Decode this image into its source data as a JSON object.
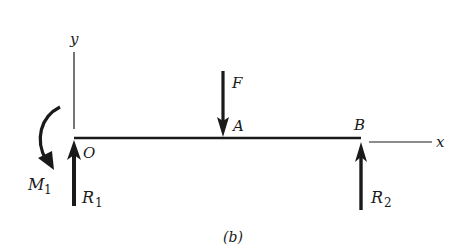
{
  "figure": {
    "caption": "(b)",
    "colors": {
      "ink": "#1a1a1a",
      "background": "#ffffff"
    }
  },
  "axes": {
    "y_label": "y",
    "x_label": "x"
  },
  "points": {
    "origin": "O",
    "load_point": "A",
    "support_point": "B"
  },
  "loads": {
    "force": {
      "symbol": "F",
      "direction": "down"
    },
    "moment": {
      "symbol": "M",
      "subscript": "1",
      "direction": "clockwise"
    },
    "reaction_left": {
      "symbol": "R",
      "subscript": "1",
      "direction": "up"
    },
    "reaction_right": {
      "symbol": "R",
      "subscript": "2",
      "direction": "up"
    }
  }
}
